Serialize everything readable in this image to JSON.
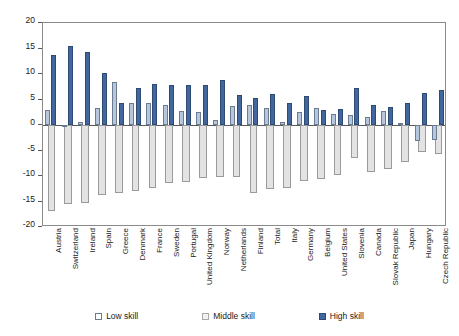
{
  "chart_data": {
    "type": "bar",
    "title": "",
    "xlabel": "",
    "ylabel": "",
    "ylim": [
      -20,
      20
    ],
    "yticks": [
      20,
      15,
      10,
      5,
      0,
      -5,
      -10,
      -15,
      -20
    ],
    "ytick_labels": [
      "20",
      "15",
      "10",
      "5",
      "0",
      "-5",
      "-10",
      "-15",
      "-20"
    ],
    "grid": false,
    "legend_position": "bottom",
    "categories": [
      "Austria",
      "Switzerland",
      "Ireland",
      "Spain",
      "Greece",
      "Denmark",
      "France",
      "Sweden",
      "Portugal",
      "United Kingdom",
      "Norway",
      "Netherlands",
      "Finland",
      "Total",
      "Italy",
      "Germany",
      "Belgium",
      "United States",
      "Slovenia",
      "Canada",
      "Slovak Republic",
      "Japan",
      "Hungary",
      "Czech Republic"
    ],
    "series": [
      {
        "name": "Low skill",
        "color": "#b6c7dd",
        "values": [
          3.0,
          0.0,
          0.6,
          3.4,
          8.5,
          4.4,
          4.3,
          4.0,
          2.8,
          2.6,
          0.9,
          3.7,
          3.9,
          3.4,
          0.5,
          2.5,
          3.3,
          2.1,
          2.0,
          1.5,
          2.7,
          0.4,
          -3.2,
          -3.0
        ]
      },
      {
        "name": "Middle skill",
        "color": "#e3e3e3",
        "values": [
          -16.8,
          -15.5,
          -15.2,
          -13.7,
          -13.4,
          -12.9,
          -12.3,
          -11.4,
          -11.2,
          -10.4,
          -10.2,
          -10.2,
          -13.3,
          -12.5,
          -12.4,
          -11.0,
          -10.5,
          -9.9,
          -6.5,
          -9.2,
          -8.6,
          -7.3,
          -5.3,
          -5.6
        ]
      },
      {
        "name": "High skill",
        "color": "#41679e",
        "values": [
          13.8,
          15.5,
          14.3,
          10.1,
          4.4,
          7.2,
          8.0,
          7.8,
          7.8,
          7.8,
          8.9,
          5.9,
          5.3,
          6.0,
          4.3,
          5.6,
          3.0,
          3.2,
          7.3,
          4.0,
          3.6,
          4.3,
          6.2,
          6.9
        ]
      }
    ]
  },
  "legend": {
    "items": [
      {
        "label": "Low skill",
        "key": "low"
      },
      {
        "label": "Middle skill",
        "key": "mid"
      },
      {
        "label": "High skill",
        "key": "high"
      }
    ]
  }
}
